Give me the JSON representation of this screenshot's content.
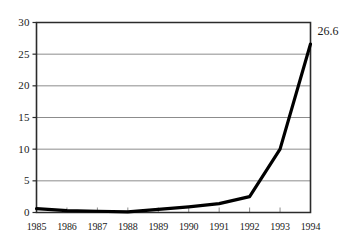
{
  "chart_data": {
    "type": "line",
    "title": "",
    "subtitle": "",
    "xlabel": "",
    "ylabel": "",
    "categories": [
      "1985",
      "1986",
      "1987",
      "1988",
      "1989",
      "1990",
      "1991",
      "1992",
      "1993",
      "1994"
    ],
    "x": [
      1985,
      1986,
      1987,
      1988,
      1989,
      1990,
      1991,
      1992,
      1993,
      1994
    ],
    "values": [
      0.6,
      0.3,
      0.2,
      0.1,
      0.5,
      0.9,
      1.4,
      2.5,
      10.0,
      26.6
    ],
    "series": [
      {
        "name": "",
        "values": [
          0.6,
          0.3,
          0.2,
          0.1,
          0.5,
          0.9,
          1.4,
          2.5,
          10.0,
          26.6
        ]
      }
    ],
    "ylim": [
      0,
      30
    ],
    "yticks": [
      0,
      5,
      10,
      15,
      20,
      25,
      30
    ],
    "ytick_labels": [
      "0",
      "5",
      "10",
      "15",
      "20",
      "25",
      "30"
    ],
    "xtick_labels": [
      "1985",
      "1986",
      "1987",
      "1988",
      "1989",
      "1990",
      "1991",
      "1992",
      "1993",
      "1994"
    ],
    "grid": "horizontal",
    "legend": "none",
    "annotations": [
      {
        "text": "26.6",
        "x": 1994,
        "y": 26.6
      }
    ],
    "line_color": "#000000",
    "grid_color": "#8c8c8c",
    "axis_color": "#2b2b2b",
    "background_color": "#ffffff"
  }
}
